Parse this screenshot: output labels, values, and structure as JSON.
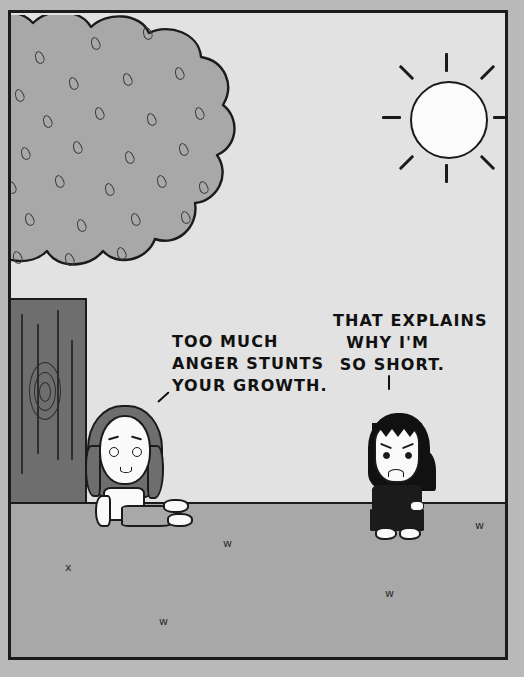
{
  "comic": {
    "title": "Comic strip panel",
    "panel": {
      "border_color": "#1b1b1b",
      "sky_color": "#e2e2e2",
      "ground_color": "#a8a8a8"
    },
    "dialogue": [
      {
        "id": "left",
        "speaker": "sitting-girl",
        "text": "TOO MUCH\nANGER STUNTS\nYOUR GROWTH.",
        "pointer": "diagonal-tick"
      },
      {
        "id": "right",
        "speaker": "standing-girl",
        "text": "THAT EXPLAINS\n  WHY I'M\n SO SHORT.",
        "pointer": "vertical-tick"
      }
    ],
    "scene": {
      "sun": {
        "label": "sun",
        "fill": "#fbfbfb",
        "rays": 8
      },
      "tree": {
        "label": "tree",
        "canopy_fill": "#a8a8a8",
        "trunk_fill": "#6e6e6e",
        "leaf_marks": 26
      },
      "ground": {
        "label": "ground",
        "grass_tufts": 5
      },
      "characters": [
        {
          "id": "sitting-girl",
          "label": "sad girl sitting against tree",
          "hair": "#6e6e6e",
          "shirt": "#fafafa",
          "pants": "#a8a8a8",
          "expression": "sad"
        },
        {
          "id": "standing-girl",
          "label": "angry girl standing",
          "hair": "#111111",
          "shirt": "#1b1b1b",
          "skirt": "#1b1b1b",
          "expression": "angry"
        }
      ]
    }
  }
}
